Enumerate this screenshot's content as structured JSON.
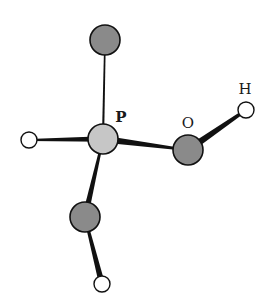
{
  "diagram": {
    "title": "",
    "molecule": "H3PO3 (phosphorous acid) ball-and-stick",
    "colors": {
      "background": "#ffffff",
      "phosphorus": "#c6c6c6",
      "oxygen": "#8a8a8a",
      "hydrogen": "#ffffff",
      "outline": "#111111",
      "bond": "#111111"
    },
    "atoms": [
      {
        "id": "P",
        "element": "P",
        "x": 103,
        "y": 139,
        "r": 15,
        "fill": "phosphorus"
      },
      {
        "id": "O1",
        "element": "O",
        "x": 105,
        "y": 40,
        "r": 15,
        "fill": "oxygen"
      },
      {
        "id": "O2",
        "element": "O",
        "x": 188,
        "y": 150,
        "r": 15,
        "fill": "oxygen"
      },
      {
        "id": "O3",
        "element": "O",
        "x": 85,
        "y": 217,
        "r": 15,
        "fill": "oxygen"
      },
      {
        "id": "H1",
        "element": "H",
        "x": 29,
        "y": 140,
        "r": 8,
        "fill": "hydrogen"
      },
      {
        "id": "H2",
        "element": "H",
        "x": 246,
        "y": 110,
        "r": 8,
        "fill": "hydrogen"
      },
      {
        "id": "H3",
        "element": "H",
        "x": 102,
        "y": 284,
        "r": 8,
        "fill": "hydrogen"
      }
    ],
    "bonds": [
      {
        "from": "P",
        "to": "O1",
        "w1": 2.2,
        "w2": 1.6
      },
      {
        "from": "P",
        "to": "H1",
        "w1": 5.5,
        "w2": 2.0
      },
      {
        "from": "P",
        "to": "O2",
        "w1": 7.0,
        "w2": 2.0
      },
      {
        "from": "P",
        "to": "O3",
        "w1": 2.0,
        "w2": 6.0
      },
      {
        "from": "O2",
        "to": "H2",
        "w1": 7.0,
        "w2": 3.0
      },
      {
        "from": "O3",
        "to": "H3",
        "w1": 2.5,
        "w2": 6.0
      }
    ],
    "labels": [
      {
        "id": "label-P",
        "text": "P",
        "x": 121,
        "y": 122,
        "size": 15,
        "weight": "bold"
      },
      {
        "id": "label-O",
        "text": "O",
        "x": 188,
        "y": 128,
        "size": 15,
        "weight": "normal"
      },
      {
        "id": "label-H",
        "text": "H",
        "x": 245,
        "y": 94,
        "size": 15,
        "weight": "normal"
      }
    ]
  }
}
